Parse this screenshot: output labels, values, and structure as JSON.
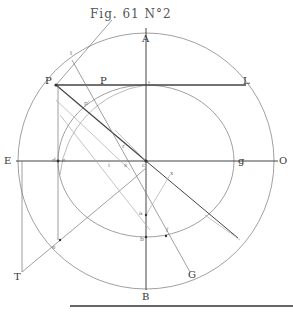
{
  "figure": {
    "title": "Fig. 61 N°2",
    "stroke_color": "#555555",
    "light_stroke_color": "#999999",
    "background": "#ffffff"
  },
  "labels": {
    "A": "A",
    "B": "B",
    "E": "E",
    "O": "O",
    "P_left": "P",
    "P_mid": "P",
    "L": "L",
    "T": "T",
    "G": "G",
    "g": "g",
    "d": "d",
    "t_top": "t",
    "t_axis": "t",
    "c": "c",
    "i": "i",
    "a": "a",
    "b": "b",
    "f": "f",
    "e_top": "e",
    "e_bottom": "e",
    "p_prime": "p'",
    "r": "r",
    "s": "s",
    "x": "x"
  }
}
